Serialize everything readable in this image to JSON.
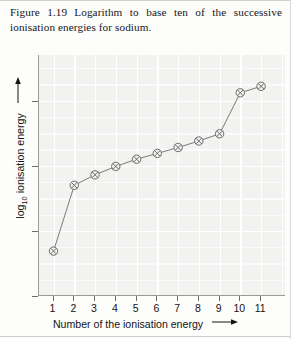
{
  "caption": {
    "figure_label": "Figure 1.19",
    "text": "Logarithm to base ten of the successive ionisation energies for sodium."
  },
  "chart_data": {
    "type": "line",
    "title": "",
    "xlabel": "Number of the ionisation energy",
    "ylabel": "log10 ionisation energy",
    "ylabel_base": "log",
    "ylabel_sub": "10",
    "ylabel_rest": " ionisation energy",
    "x": [
      1,
      2,
      3,
      4,
      5,
      6,
      7,
      8,
      9,
      10,
      11
    ],
    "values": [
      2.69,
      3.7,
      3.86,
      3.99,
      4.1,
      4.19,
      4.28,
      4.38,
      4.49,
      5.12,
      5.22
    ],
    "xticklabels": [
      "1",
      "2",
      "3",
      "4",
      "5",
      "6",
      "7",
      "8",
      "9",
      "10",
      "11"
    ],
    "yticklabels": [
      "2",
      "3",
      "4",
      "5"
    ],
    "yticks": [
      2,
      3,
      4,
      5
    ],
    "xlim": [
      0.3,
      12.2
    ],
    "ylim": [
      2.0,
      5.7
    ],
    "grid": true,
    "legend": "none",
    "marker": "circle-with-cross",
    "marker_color": "#6b6b6b",
    "line_color": "#7a7a7a",
    "plot_background": "#f2f2f0",
    "grid_color": "#ffffff",
    "axis_color": "#9a9a98",
    "x_arrow": "→",
    "y_arrow": "↑"
  }
}
